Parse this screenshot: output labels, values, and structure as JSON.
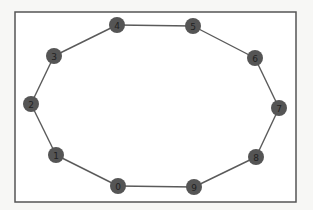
{
  "diagram": {
    "type": "graph",
    "layout": "cycle",
    "frame": {
      "x": 15,
      "y": 12,
      "width": 281,
      "height": 190
    },
    "colors": {
      "background": "#f7f7f5",
      "frame_fill": "#ffffff",
      "frame_stroke": "#555555",
      "node_fill": "#555555",
      "edge": "#5a5a5a",
      "label": "#222222"
    },
    "node_radius": 8,
    "nodes": [
      {
        "id": "0",
        "label": "0",
        "x": 118,
        "y": 186
      },
      {
        "id": "1",
        "label": "1",
        "x": 56,
        "y": 155
      },
      {
        "id": "2",
        "label": "2",
        "x": 31,
        "y": 104
      },
      {
        "id": "3",
        "label": "3",
        "x": 54,
        "y": 56
      },
      {
        "id": "4",
        "label": "4",
        "x": 117,
        "y": 25
      },
      {
        "id": "5",
        "label": "5",
        "x": 193,
        "y": 26
      },
      {
        "id": "6",
        "label": "6",
        "x": 255,
        "y": 58
      },
      {
        "id": "7",
        "label": "7",
        "x": 279,
        "y": 108
      },
      {
        "id": "8",
        "label": "8",
        "x": 256,
        "y": 157
      },
      {
        "id": "9",
        "label": "9",
        "x": 194,
        "y": 187
      }
    ],
    "edges": [
      [
        "0",
        "1"
      ],
      [
        "1",
        "2"
      ],
      [
        "2",
        "3"
      ],
      [
        "3",
        "4"
      ],
      [
        "4",
        "5"
      ],
      [
        "5",
        "6"
      ],
      [
        "6",
        "7"
      ],
      [
        "7",
        "8"
      ],
      [
        "8",
        "9"
      ],
      [
        "9",
        "0"
      ]
    ]
  }
}
